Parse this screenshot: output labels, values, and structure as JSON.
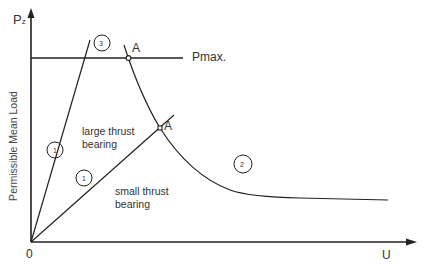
{
  "diagram": {
    "y_axis_symbol": "P",
    "y_axis_subscript": "z",
    "y_axis_label": "Permissible Mean Load",
    "x_axis_label": "U",
    "origin_label": "0",
    "pmax_label": "Pmax.",
    "point_labels": [
      "A",
      "A"
    ],
    "curve_markers": [
      "1",
      "1",
      "2",
      "3"
    ],
    "region_large": [
      "large thrust",
      "bearing"
    ],
    "region_small": [
      "small thrust",
      "bearing"
    ]
  }
}
